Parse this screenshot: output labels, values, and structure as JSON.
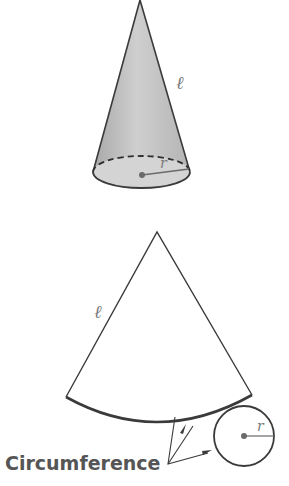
{
  "cone": {
    "slant_label": "ℓ",
    "radius_label": "r"
  },
  "net": {
    "slant_label": "ℓ",
    "radius_label": "r",
    "caption": "Circumference"
  },
  "colors": {
    "stroke": "#3a3a3a",
    "fill": "#c8c8c8",
    "label": "#7a7a7a",
    "caption": "#555555"
  }
}
